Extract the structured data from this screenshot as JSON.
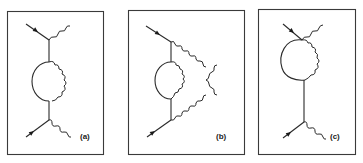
{
  "figure": {
    "panels": [
      {
        "id": "a",
        "label": "(a)",
        "description": "Fermion self-energy loop inserted on internal propagator between two vertices"
      },
      {
        "id": "b",
        "label": "(b)",
        "description": "Self-energy loop with photon lines crossing to outgoing legs"
      },
      {
        "id": "c",
        "label": "(c)",
        "description": "Vertex correction loop at upper vertex"
      }
    ],
    "colors": {
      "line": "#2a2a2a",
      "background": "#ffffff"
    }
  }
}
